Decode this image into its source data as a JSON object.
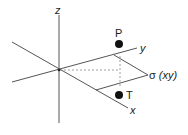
{
  "diagram": {
    "axes": {
      "z_label": "z",
      "y_label": "y",
      "x_label": "x"
    },
    "points": {
      "P_label": "P",
      "T_label": "T"
    },
    "plane": {
      "symbol": "σ",
      "label": "(xy)"
    },
    "colors": {
      "line": "#444444",
      "dashed": "#888888",
      "point": "#111111"
    }
  }
}
